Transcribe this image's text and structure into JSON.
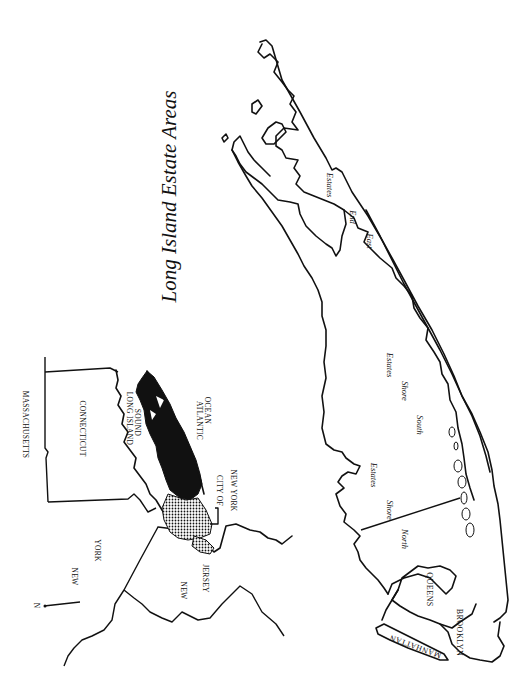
{
  "title": "Long Island Estate Areas",
  "inset_map": {
    "labels": {
      "massachusetts": "MASSACHUSETTS",
      "connecticut": "CONNECTICUT",
      "long_island_sound_1": "LONG ISLAND",
      "long_island_sound_2": "SOUND",
      "atlantic_ocean_1": "ATLANTIC",
      "atlantic_ocean_2": "OCEAN",
      "city_of_ny_1": "CITY OF",
      "city_of_ny_2": "NEW YORK",
      "new_york_1": "NEW",
      "new_york_2": "YORK",
      "new_jersey_1": "NEW",
      "new_jersey_2": "JERSEY",
      "north_arrow": "N"
    },
    "legend_fills": {
      "long_island": "#111111",
      "city_of_new_york": "dotted"
    }
  },
  "main_map": {
    "estate_areas": {
      "north_shore_1": "North",
      "north_shore_2": "Shore",
      "north_shore_3": "Estates",
      "south_shore_1": "South",
      "south_shore_2": "Shore",
      "south_shore_3": "Estates",
      "east_end_1": "East",
      "east_end_2": "End",
      "east_end_3": "Estates"
    },
    "boroughs": {
      "queens": "QUEENS",
      "brooklyn": "BROOKLYN",
      "manhattan": "MANHATTAN"
    }
  }
}
